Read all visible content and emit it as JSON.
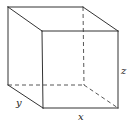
{
  "diagram": {
    "title": "",
    "type": "cube-wireframe",
    "colors": {
      "line": "#333333",
      "background": "#ffffff",
      "text": "#222222"
    },
    "vertices": {
      "back_top_left": [
        8,
        7
      ],
      "back_top_right": [
        83,
        7
      ],
      "back_bottom_left": [
        8,
        85
      ],
      "back_bottom_right": [
        84,
        85
      ],
      "front_top_left": [
        42,
        31
      ],
      "front_top_right": [
        118,
        31
      ],
      "front_bottom_left": [
        43,
        108
      ],
      "front_bottom_right": [
        118,
        108
      ]
    },
    "labels": {
      "x": "x",
      "y": "y",
      "z": "z"
    }
  }
}
